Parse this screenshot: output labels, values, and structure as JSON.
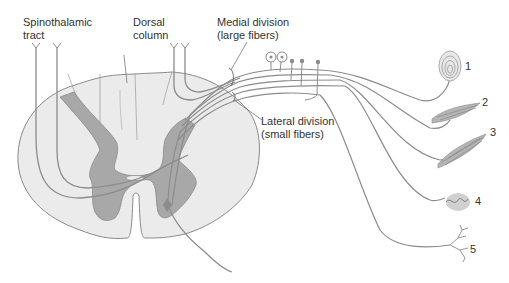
{
  "labels": {
    "spinothalamic_line1": "Spinothalamic",
    "spinothalamic_line2": "tract",
    "dorsal_line1": "Dorsal",
    "dorsal_line2": "column",
    "medial_line1": "Medial division",
    "medial_line2": "(large fibers)",
    "lateral_line1": "Lateral division",
    "lateral_line2": "(small fibers)"
  },
  "receptors": [
    {
      "number": "1"
    },
    {
      "number": "2"
    },
    {
      "number": "3"
    },
    {
      "number": "4"
    },
    {
      "number": "5"
    }
  ],
  "colors": {
    "white_matter": "#ebebeb",
    "gray_matter": "#a8a8a8",
    "outline": "#8a8a8a",
    "fiber": "#8c8c8c",
    "text": "#333333"
  }
}
